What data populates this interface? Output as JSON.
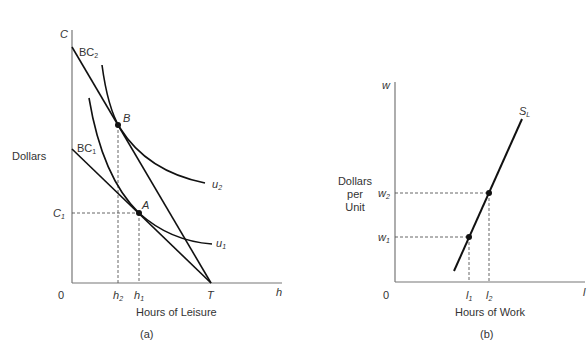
{
  "panel_a": {
    "caption": "(a)",
    "y_axis_label": "Dollars",
    "y_axis_symbol": "C",
    "x_axis_label": "Hours of Leisure",
    "x_axis_symbol": "h",
    "origin": "0",
    "budget_constraints": [
      {
        "name": "BC",
        "sub": "2"
      },
      {
        "name": "BC",
        "sub": "1"
      }
    ],
    "indifference_curves": [
      {
        "name": "u",
        "sub": "2"
      },
      {
        "name": "u",
        "sub": "1"
      }
    ],
    "points": [
      {
        "label": "B"
      },
      {
        "label": "A"
      }
    ],
    "y_ticks": [
      {
        "name": "C",
        "sub": "1"
      }
    ],
    "x_ticks": [
      {
        "name": "h",
        "sub": "2"
      },
      {
        "name": "h",
        "sub": "1"
      },
      {
        "name": "T",
        "sub": ""
      }
    ]
  },
  "panel_b": {
    "caption": "(b)",
    "y_axis_label_lines": [
      "Dollars",
      "per",
      "Unit"
    ],
    "y_axis_symbol": "w",
    "x_axis_label": "Hours of Work",
    "x_axis_symbol": "l",
    "origin": "0",
    "curve": {
      "name": "S",
      "sub": "L"
    },
    "y_ticks": [
      {
        "name": "w",
        "sub": "2"
      },
      {
        "name": "w",
        "sub": "1"
      }
    ],
    "x_ticks": [
      {
        "name": "l",
        "sub": "1"
      },
      {
        "name": "l",
        "sub": "2"
      }
    ]
  },
  "colors": {
    "line": "#111111",
    "axis": "#666666",
    "text": "#333333"
  }
}
